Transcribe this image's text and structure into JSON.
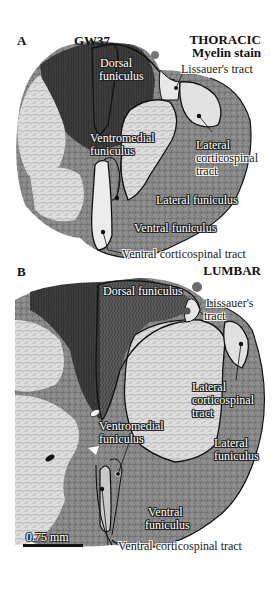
{
  "panel_a": {
    "letter": "A",
    "age": "GW37",
    "level": "THORACIC",
    "stain": "Myelin stain",
    "labels": {
      "dorsal_funiculus_1": "Dorsal",
      "dorsal_funiculus_2": "funiculus",
      "lissauers_tract": "Lissauer's tract",
      "ventromedial_1": "Ventromedial",
      "ventromedial_2": "funiculus",
      "lateral_cst_1": "Lateral",
      "lateral_cst_2": "corticospinal",
      "lateral_cst_3": "tract",
      "lateral_funiculus": "Lateral funiculus",
      "ventral_funiculus": "Ventral funiculus",
      "ventral_cst": "Ventral corticospinal tract"
    }
  },
  "panel_b": {
    "letter": "B",
    "level": "LUMBAR",
    "labels": {
      "dorsal_funiculus": "Dorsal funiculus",
      "lissauers_1": "Lissauer's",
      "lissauers_2": "tract",
      "lateral_cst_1": "Lateral",
      "lateral_cst_2": "corticospinal",
      "lateral_cst_3": "tract",
      "lateral_funiculus_1": "Lateral",
      "lateral_funiculus_2": "funiculus",
      "ventromedial_1": "Ventromedial",
      "ventromedial_2": "funiculus",
      "ventral_funiculus_1": "Ventral",
      "ventral_funiculus_2": "funiculus",
      "ventral_cst": "Ventral corticospinal tract"
    },
    "scale_bar": "0.75 mm"
  },
  "colors": {
    "white_matter_dark": "#4a4a4a",
    "gray_matter_light": "#d9d9d9",
    "outline": "#111111",
    "background": "#ffffff"
  }
}
